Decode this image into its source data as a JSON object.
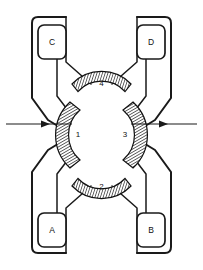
{
  "figure": {
    "background_color": "#ffffff",
    "line_color": "#1a1a1a",
    "hatch_color": "#111111"
  },
  "coils": [
    {
      "id": "A",
      "label": "A",
      "position": "bottom-left",
      "connects_to": [
        "1",
        "2"
      ]
    },
    {
      "id": "B",
      "label": "B",
      "position": "bottom-right",
      "connects_to": [
        "3",
        "2"
      ]
    },
    {
      "id": "C",
      "label": "C",
      "position": "top-left",
      "connects_to": [
        "1",
        "4"
      ]
    },
    {
      "id": "D",
      "label": "D",
      "position": "top-right",
      "connects_to": [
        "3",
        "4"
      ]
    }
  ],
  "poles": [
    {
      "id": "1",
      "label": "1",
      "position": "left",
      "hatched": true
    },
    {
      "id": "2",
      "label": "2",
      "position": "bottom",
      "hatched": true
    },
    {
      "id": "3",
      "label": "3",
      "position": "right",
      "hatched": true
    },
    {
      "id": "4",
      "label": "4",
      "position": "top",
      "hatched": true
    }
  ],
  "arrows": [
    {
      "id": "left-arrow",
      "direction": "right",
      "side": "left"
    },
    {
      "id": "right-arrow",
      "direction": "right",
      "side": "right"
    }
  ],
  "center": {
    "shape": "circular-bore",
    "fill": "#ffffff"
  }
}
